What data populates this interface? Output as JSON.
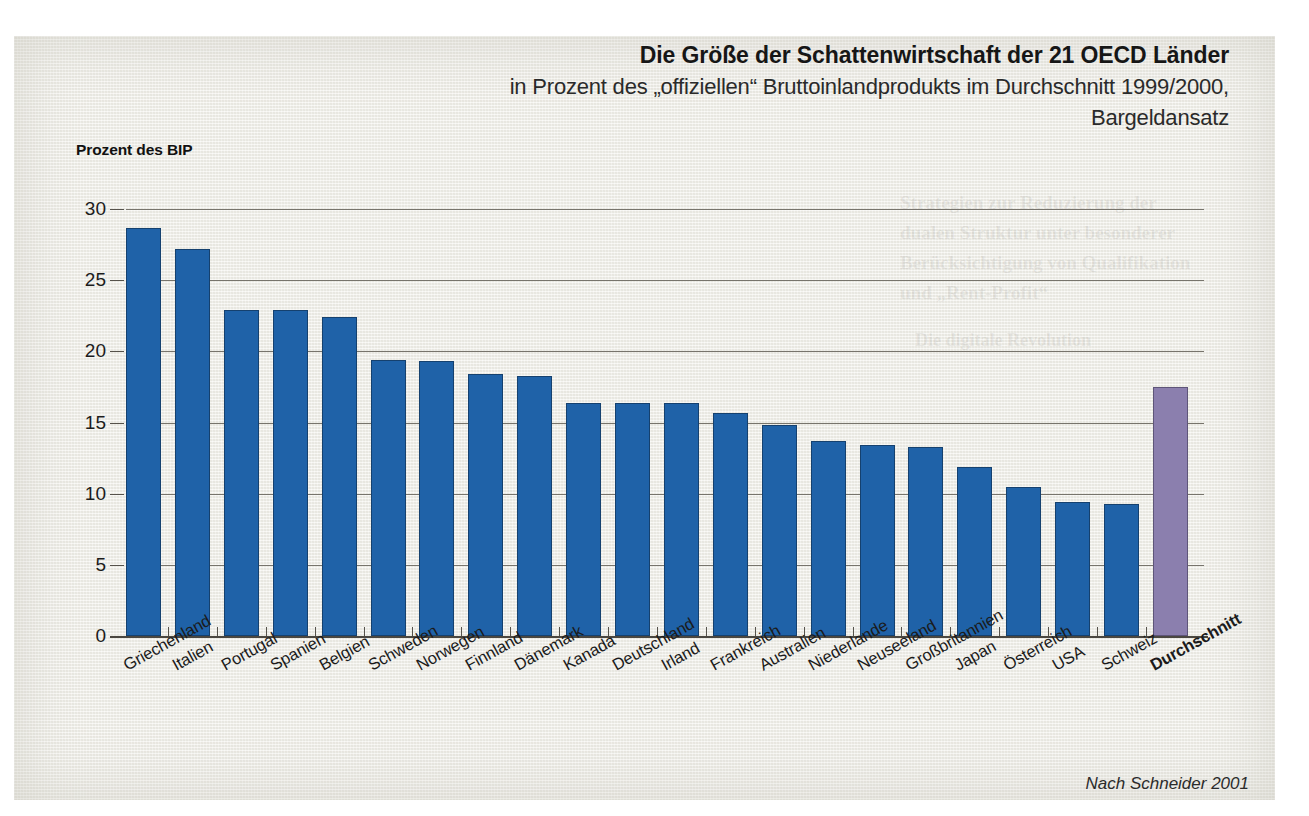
{
  "title": "Die Größe der Schattenwirtschaft der 21 OECD Länder",
  "subtitle_line1": "in Prozent des „offiziellen“ Bruttoinlandprodukts im Durchschnitt 1999/2000,",
  "subtitle_line2": "Bargeldansatz",
  "y_axis_title": "Prozent des BIP",
  "source_note": "Nach Schneider 2001",
  "colors": {
    "bar": "#1f62a8",
    "bar_average": "#8b7fae",
    "grid": "#77746c",
    "text": "#1b1b1b",
    "paper": "#f0efe9"
  },
  "chart_data": {
    "type": "bar",
    "title": "Die Größe der Schattenwirtschaft der 21 OECD Länder",
    "subtitle": "in Prozent des „offiziellen“ Bruttoinlandprodukts im Durchschnitt 1999/2000, Bargeldansatz",
    "xlabel": "",
    "ylabel": "Prozent des BIP",
    "ylim": [
      0,
      30
    ],
    "yticks": [
      0,
      5,
      10,
      15,
      20,
      25,
      30
    ],
    "grid": true,
    "legend": "none",
    "source": "Nach Schneider 2001",
    "categories": [
      "Griechenland",
      "Italien",
      "Portugal",
      "Spanien",
      "Belgien",
      "Schweden",
      "Norwegen",
      "Finnland",
      "Dänemark",
      "Kanada",
      "Deutschland",
      "Irland",
      "Frankreich",
      "Australien",
      "Niederlande",
      "Neuseeland",
      "Großbritannien",
      "Japan",
      "Österreich",
      "USA",
      "Schweiz",
      "Durchschnitt"
    ],
    "values": [
      28.7,
      27.2,
      22.9,
      22.9,
      22.4,
      19.4,
      19.3,
      18.4,
      18.3,
      16.4,
      16.4,
      16.4,
      15.7,
      14.8,
      13.7,
      13.4,
      13.3,
      11.9,
      10.5,
      9.4,
      9.3,
      17.5
    ],
    "highlight_index": 21,
    "highlight_label": "Durchschnitt"
  },
  "ghost_text": {
    "g1": "Strategien zur Reduzierung der",
    "g2": "dualen Struktur unter besonderer",
    "g3": "Berücksichtigung von Qualifikation",
    "g4": "und „Rent-Profit“",
    "g5": "Die digitale Revolution"
  }
}
